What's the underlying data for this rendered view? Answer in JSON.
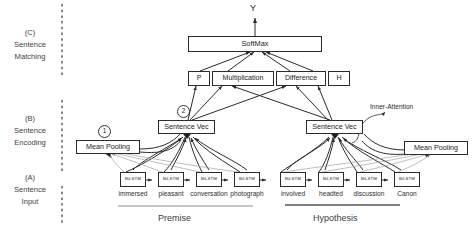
{
  "diagram": {
    "output": {
      "label": "Y"
    },
    "softmax": {
      "label": "SoftMax"
    },
    "components": [
      {
        "label": "P"
      },
      {
        "label": "Multiplication"
      },
      {
        "label": "Difference"
      },
      {
        "label": "H"
      }
    ],
    "sentence_vectors": [
      {
        "label": "Sentence Vec",
        "side": "premise"
      },
      {
        "label": "Sentence Vec",
        "side": "hypothesis"
      }
    ],
    "pooling": [
      {
        "label": "Mean Pooling",
        "side": "premise"
      },
      {
        "label": "Mean Pooling",
        "side": "hypothesis"
      }
    ],
    "markers": [
      {
        "label": "1"
      },
      {
        "label": "2"
      }
    ],
    "annotations": [
      {
        "label": "Inner-Attention"
      }
    ],
    "stages": [
      {
        "id": "c",
        "tag": "(C)",
        "line1": "Sentence",
        "line2": "Matching"
      },
      {
        "id": "b",
        "tag": "(B)",
        "line1": "Sentence",
        "line2": "Encoding"
      },
      {
        "id": "a",
        "tag": "(A)",
        "line1": "Sentence",
        "line2": "Input"
      }
    ],
    "premise": {
      "section_label": "Premise",
      "cells": [
        {
          "label": "BiLSTM",
          "word": "immersed"
        },
        {
          "label": "BiLSTM",
          "word": "pleasant"
        },
        {
          "label": "BiLSTM",
          "word": "conversation"
        },
        {
          "label": "BiLSTM",
          "word": "photograph"
        }
      ]
    },
    "hypothesis": {
      "section_label": "Hypothesis",
      "cells": [
        {
          "label": "BiLSTM",
          "word": "involved"
        },
        {
          "label": "BiLSTM",
          "word": "headted"
        },
        {
          "label": "BiLSTM",
          "word": "discussion"
        },
        {
          "label": "BiLSTM",
          "word": "Canon"
        }
      ]
    },
    "colors": {
      "stroke": "#2b2b2b",
      "light_stroke": "#9a9a9a",
      "text": "#1c1c1c",
      "background": "#ffffff"
    }
  }
}
